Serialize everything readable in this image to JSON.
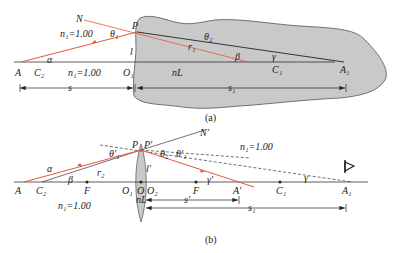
{
  "figure_a": {
    "caption": "(a)",
    "labels": {
      "N": "N",
      "P": "P",
      "theta1": "θ₁",
      "theta2": "θ₂",
      "r1": "r₁",
      "n1_upper": "n₁=1.00",
      "n1_lower": "n₁=1.00",
      "alpha": "α",
      "l": "l",
      "A": "A",
      "C2": "C₂",
      "O1": "O₁",
      "nL": "nL",
      "beta": "β",
      "C1": "C₁",
      "gamma": "γ",
      "A1": "A₁",
      "s": "s",
      "s1": "s₁"
    },
    "colors": {
      "ray": "#e8553a",
      "medium": "#c9c9c9",
      "line": "#333333"
    }
  },
  "figure_b": {
    "caption": "(b)",
    "labels": {
      "P": "P",
      "Pp": "P′",
      "Np": "N′",
      "theta1p": "θ′₁",
      "theta2": "θ₂",
      "theta1pp": "θ′₁",
      "n1_upper": "n₁=1.00",
      "n1_lower": "n₁=1.00",
      "alpha": "α",
      "beta": "β",
      "r2": "r₂",
      "lp": "l′",
      "A": "A",
      "C2": "C₂",
      "F_left": "F",
      "O1": "O₁",
      "O": "O",
      "O2": "O₂",
      "nL": "nL",
      "F_right": "F",
      "Ap": "A′",
      "C1": "C₁",
      "A1": "A₁",
      "gammap": "γ′",
      "gamma": "γ",
      "sp": "s′",
      "s1": "s₁"
    },
    "icons": [
      "eye-icon"
    ]
  }
}
